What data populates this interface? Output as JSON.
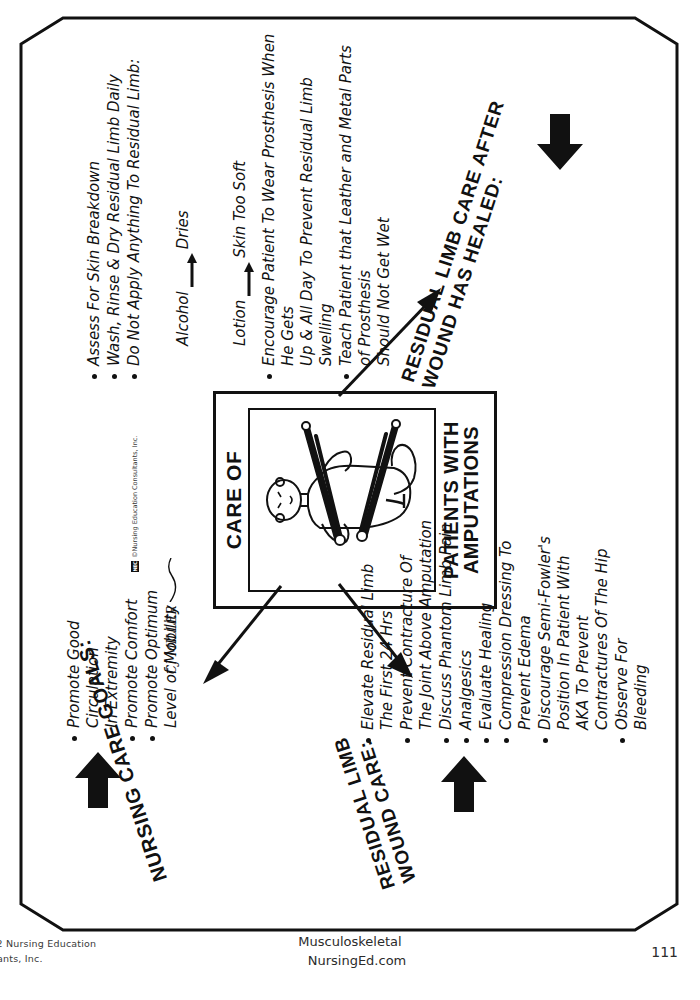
{
  "poster": {
    "center_card": {
      "title": "CARE OF",
      "subtitle_line1": "PATIENTS WITH",
      "subtitle_line2": "AMPUTATIONS",
      "illustration": "amputee-patient-with-crutches"
    },
    "sections": [
      {
        "id": "nursing-care-goals",
        "heading": "NURSING CARE GOALS:",
        "items": [
          "Promote Good\nCirculation\nIn Extremity",
          "Promote Comfort",
          "Promote Optimum\nLevel of Mobility"
        ]
      },
      {
        "id": "residual-limb-wound-care",
        "heading": "RESIDUAL LIMB\nWOUND CARE:",
        "items": [
          "Elevate Residual Limb\nThe First 24 Hrs",
          "Prevent Contracture Of\nThe Joint Above Amputation",
          "Discuss Phantom Limb Pain",
          "Analgesics",
          "Evaluate Healing",
          "Compression Dressing To\nPrevent Edema",
          "Discourage Semi-Fowler's\nPosition In Patient With\nAKA To Prevent\nContractures Of The Hip",
          "Observe For\nBleeding"
        ]
      },
      {
        "id": "residual-limb-care-after-healed",
        "heading": "RESIDUAL LIMB CARE AFTER\nWOUND HAS HEALED:",
        "items": [
          "Assess For Skin Breakdown",
          "Wash, Rinse & Dry Residual Limb Daily",
          "Do Not Apply Anything To Residual Limb:",
          "Encourage Patient To Wear Prosthesis When He Gets\nUp & All Day To Prevent Residual Limb Swelling",
          "Teach Patient that Leather and Metal Parts of Prosthesis\nShould Not Get Wet"
        ],
        "sub_reactions": [
          {
            "cause": "Alcohol",
            "arrow": "right-arrow",
            "effect": "Dries"
          },
          {
            "cause": "Lotion",
            "arrow": "right-arrow",
            "effect": "Skin Too Soft"
          }
        ]
      }
    ],
    "credit_text": "©Nursing Education Consultants, Inc.",
    "credit_logo_label": "NEC",
    "signature": "CJ MILLER"
  },
  "footer": {
    "copyright_line1": "012 Nursing Education",
    "copyright_line2": "ultants, Inc.",
    "center_line1": "Musculoskeletal",
    "center_line2": "NursingEd.com",
    "page_number": "111"
  },
  "colors": {
    "ink": "#111111",
    "paper": "#ffffff",
    "muted": "#3a3a3a"
  }
}
